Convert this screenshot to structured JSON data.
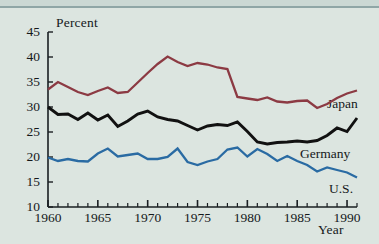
{
  "figure": {
    "background_color": "#dce5e0",
    "axis_color": "#1a1f22",
    "text_color": "#14181a"
  },
  "axes": {
    "ylabel": "Percent",
    "xlabel": "Year",
    "ytick_labels": [
      "45",
      "40",
      "35",
      "30",
      "25",
      "20",
      "15",
      "10"
    ],
    "xtick_labels": [
      "1960",
      "1965",
      "1970",
      "1975",
      "1980",
      "1985",
      "1990"
    ]
  },
  "series_labels": {
    "japan": "Japan",
    "germany": "Germany",
    "us": "U.S."
  },
  "chart_data": {
    "type": "line",
    "title": "",
    "xlabel": "Year",
    "ylabel": "Percent",
    "xlim": [
      1960,
      1991
    ],
    "ylim": [
      10,
      45
    ],
    "ytick_values": [
      10,
      15,
      20,
      25,
      30,
      35,
      40,
      45
    ],
    "xtick_values": [
      1960,
      1965,
      1970,
      1975,
      1980,
      1985,
      1990
    ],
    "minor_xticks": "every 1 year",
    "grid": false,
    "legend": "inline labels at right end of each line",
    "x": [
      1960,
      1961,
      1962,
      1963,
      1964,
      1965,
      1966,
      1967,
      1968,
      1969,
      1970,
      1971,
      1972,
      1973,
      1974,
      1975,
      1976,
      1977,
      1978,
      1979,
      1980,
      1981,
      1982,
      1983,
      1984,
      1985,
      1986,
      1987,
      1988,
      1989,
      1990,
      1991
    ],
    "series": [
      {
        "name": "Japan",
        "color": "#8c3a43",
        "values": [
          33.5,
          35.0,
          34.0,
          33.0,
          32.4,
          33.2,
          33.9,
          32.8,
          33.0,
          34.9,
          36.8,
          38.6,
          40.1,
          39.0,
          38.2,
          38.8,
          38.5,
          37.9,
          37.6,
          32.0,
          31.7,
          31.4,
          31.9,
          31.1,
          30.9,
          31.2,
          31.3,
          29.8,
          30.6,
          31.8,
          32.7,
          33.3
        ]
      },
      {
        "name": "Germany",
        "color": "#111111",
        "values": [
          30.0,
          28.5,
          28.6,
          27.5,
          28.8,
          27.4,
          28.4,
          26.1,
          27.2,
          28.6,
          29.2,
          28.0,
          27.5,
          27.2,
          26.3,
          25.4,
          26.2,
          26.5,
          26.3,
          27.0,
          25.1,
          23.0,
          22.6,
          22.9,
          23.0,
          23.2,
          23.0,
          23.3,
          24.3,
          25.8,
          25.1,
          27.8
        ]
      },
      {
        "name": "U.S.",
        "color": "#2a6ba3",
        "values": [
          19.9,
          19.2,
          19.6,
          19.2,
          19.1,
          20.7,
          21.7,
          20.1,
          20.4,
          20.7,
          19.6,
          19.6,
          20.0,
          21.7,
          19.0,
          18.4,
          19.1,
          19.6,
          21.5,
          21.9,
          20.1,
          21.6,
          20.6,
          19.2,
          20.2,
          19.2,
          18.4,
          17.1,
          17.9,
          17.4,
          16.9,
          15.9
        ]
      }
    ]
  }
}
